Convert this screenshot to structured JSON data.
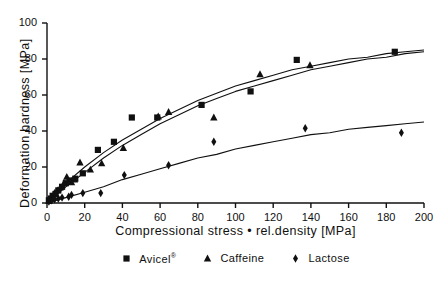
{
  "axes": {
    "xlabel": "Compressional stress • rel.density [MPa]",
    "ylabel": "Deformation hardness [MPa]",
    "xticks": [
      "0",
      "20",
      "40",
      "60",
      "80",
      "100",
      "120",
      "140",
      "160",
      "180",
      "200"
    ],
    "yticks": [
      "0",
      "20",
      "40",
      "60",
      "80",
      "100"
    ]
  },
  "legend": {
    "items": [
      {
        "label": "Avicel",
        "suffix": "®",
        "marker": "square-marker"
      },
      {
        "label": "Caffeine",
        "suffix": "",
        "marker": "triangle-marker"
      },
      {
        "label": "Lactose",
        "suffix": "",
        "marker": "diamond-marker"
      }
    ]
  },
  "colors": {
    "ink": "#101010",
    "background": "#ffffff"
  },
  "chart_data": {
    "type": "scatter",
    "title": "",
    "xlabel": "Compressional stress • rel.density [MPa]",
    "ylabel": "Deformation hardness [MPa]",
    "xlim": [
      0,
      200
    ],
    "ylim": [
      0,
      100
    ],
    "xticks": [
      0,
      20,
      40,
      60,
      80,
      100,
      120,
      140,
      160,
      180,
      200
    ],
    "yticks": [
      0,
      20,
      40,
      60,
      80,
      100
    ],
    "grid": false,
    "legend_position": "below-axes",
    "series": [
      {
        "name": "Avicel®",
        "marker": "square",
        "points": [
          [
            1.0,
            1.5
          ],
          [
            2.0,
            2.5
          ],
          [
            3.0,
            4.0
          ],
          [
            4.5,
            5.0
          ],
          [
            6.0,
            7.0
          ],
          [
            8.0,
            9.0
          ],
          [
            10.0,
            11.0
          ],
          [
            12.0,
            12.5
          ],
          [
            15.0,
            13.5
          ],
          [
            19.0,
            16.5
          ],
          [
            27.0,
            29.5
          ],
          [
            35.5,
            34.0
          ],
          [
            45.0,
            47.5
          ],
          [
            58.5,
            47.5
          ],
          [
            82.0,
            54.5
          ],
          [
            108.0,
            62.0
          ],
          [
            132.5,
            79.5
          ],
          [
            184.5,
            84.0
          ]
        ],
        "fit_curve": {
          "model": "saturating",
          "points": [
            [
              0,
              0
            ],
            [
              10,
              11
            ],
            [
              20,
              20
            ],
            [
              30,
              28
            ],
            [
              40,
              35
            ],
            [
              50,
              41
            ],
            [
              60,
              47
            ],
            [
              70,
              52
            ],
            [
              80,
              57
            ],
            [
              90,
              61
            ],
            [
              100,
              65
            ],
            [
              110,
              68
            ],
            [
              120,
              71
            ],
            [
              130,
              74
            ],
            [
              140,
              76
            ],
            [
              150,
              78
            ],
            [
              160,
              80
            ],
            [
              170,
              81
            ],
            [
              180,
              83
            ],
            [
              190,
              84
            ],
            [
              200,
              85
            ]
          ]
        }
      },
      {
        "name": "Caffeine",
        "marker": "triangle",
        "points": [
          [
            1.0,
            1.0
          ],
          [
            2.5,
            3.0
          ],
          [
            4.0,
            5.5
          ],
          [
            5.5,
            7.0
          ],
          [
            7.0,
            8.5
          ],
          [
            9.0,
            11.0
          ],
          [
            10.5,
            14.5
          ],
          [
            13.0,
            11.5
          ],
          [
            14.5,
            13.0
          ],
          [
            17.5,
            22.5
          ],
          [
            23.0,
            18.5
          ],
          [
            29.0,
            22.0
          ],
          [
            40.5,
            30.5
          ],
          [
            59.0,
            48.0
          ],
          [
            64.5,
            50.5
          ],
          [
            88.5,
            47.5
          ],
          [
            113.0,
            71.5
          ],
          [
            139.5,
            76.5
          ]
        ],
        "fit_curve": {
          "model": "saturating",
          "points": [
            [
              0,
              0
            ],
            [
              10,
              9
            ],
            [
              20,
              17
            ],
            [
              30,
              25
            ],
            [
              40,
              32
            ],
            [
              50,
              38
            ],
            [
              60,
              44
            ],
            [
              70,
              49
            ],
            [
              80,
              54
            ],
            [
              90,
              58
            ],
            [
              100,
              62
            ],
            [
              110,
              65
            ],
            [
              120,
              68
            ],
            [
              130,
              71
            ],
            [
              140,
              74
            ],
            [
              150,
              76
            ],
            [
              160,
              78
            ],
            [
              170,
              80
            ],
            [
              180,
              81
            ],
            [
              190,
              83
            ],
            [
              200,
              84
            ]
          ]
        }
      },
      {
        "name": "Lactose",
        "marker": "diamond",
        "points": [
          [
            1.0,
            0.8
          ],
          [
            2.5,
            1.5
          ],
          [
            4.0,
            2.0
          ],
          [
            6.0,
            2.5
          ],
          [
            8.0,
            3.0
          ],
          [
            11.5,
            3.5
          ],
          [
            13.0,
            4.5
          ],
          [
            19.0,
            5.5
          ],
          [
            28.5,
            5.5
          ],
          [
            41.0,
            15.5
          ],
          [
            64.5,
            21.0
          ],
          [
            88.5,
            34.0
          ],
          [
            137.0,
            41.5
          ],
          [
            188.0,
            39.0
          ]
        ],
        "fit_curve": {
          "model": "saturating",
          "points": [
            [
              0,
              0
            ],
            [
              10,
              3
            ],
            [
              20,
              6
            ],
            [
              30,
              9
            ],
            [
              40,
              13
            ],
            [
              50,
              16
            ],
            [
              60,
              19
            ],
            [
              70,
              22
            ],
            [
              80,
              25
            ],
            [
              90,
              27
            ],
            [
              100,
              30
            ],
            [
              110,
              32
            ],
            [
              120,
              34
            ],
            [
              130,
              36
            ],
            [
              140,
              38
            ],
            [
              150,
              39
            ],
            [
              160,
              41
            ],
            [
              170,
              42
            ],
            [
              180,
              43
            ],
            [
              190,
              44
            ],
            [
              200,
              45
            ]
          ]
        }
      }
    ]
  }
}
